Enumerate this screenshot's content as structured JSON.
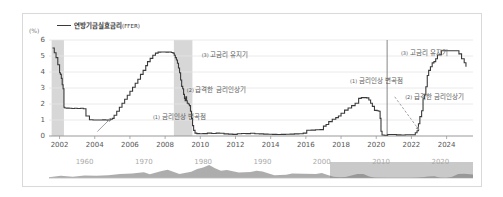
{
  "chart_data": {
    "type": "line",
    "title": "",
    "xlabel": "",
    "ylabel": "(%)",
    "unit_label": "(%)",
    "xlim": [
      2001.4,
      2025.5
    ],
    "ylim": [
      0,
      6
    ],
    "yticks": [
      0,
      1,
      2,
      3,
      4,
      5,
      6
    ],
    "ytick_labels": [
      "0",
      "1",
      "2",
      "3",
      "4",
      "5",
      "6"
    ],
    "xticks": [
      2002,
      2004,
      2006,
      2008,
      2010,
      2012,
      2014,
      2016,
      2018,
      2020,
      2022,
      2024
    ],
    "xtick_labels": [
      "2002",
      "2004",
      "2006",
      "2008",
      "2010",
      "2012",
      "2014",
      "2016",
      "2018",
      "2020",
      "2022",
      "2024"
    ],
    "grid": true,
    "legend": {
      "position": "top-left",
      "entries": [
        {
          "label": "연방기금실효금리",
          "suffix": "(FFER)",
          "color": "#3a3a3a"
        }
      ]
    },
    "series": [
      {
        "name": "연방기금실효금리(FFER)",
        "color": "#3a3a3a",
        "points": [
          [
            2001.6,
            5.5
          ],
          [
            2001.7,
            5.2
          ],
          [
            2001.8,
            4.9
          ],
          [
            2001.9,
            4.45
          ],
          [
            2002.0,
            3.95
          ],
          [
            2002.05,
            3.85
          ],
          [
            2002.1,
            3.6
          ],
          [
            2002.15,
            3.2
          ],
          [
            2002.2,
            2.95
          ],
          [
            2002.25,
            1.8
          ],
          [
            2002.3,
            1.75
          ],
          [
            2002.4,
            1.74
          ],
          [
            2002.55,
            1.73
          ],
          [
            2002.7,
            1.72
          ],
          [
            2002.85,
            1.73
          ],
          [
            2003.0,
            1.72
          ],
          [
            2003.2,
            1.73
          ],
          [
            2003.35,
            1.7
          ],
          [
            2003.5,
            1.25
          ],
          [
            2003.7,
            1.02
          ],
          [
            2003.9,
            1.0
          ],
          [
            2004.1,
            1.0
          ],
          [
            2004.3,
            1.0
          ],
          [
            2004.45,
            1.01
          ],
          [
            2004.55,
            1.02
          ],
          [
            2004.62,
            1.0
          ],
          [
            2004.72,
            0.98
          ],
          [
            2004.82,
            1.0
          ],
          [
            2004.9,
            1.05
          ],
          [
            2005.0,
            1.1
          ],
          [
            2005.1,
            1.3
          ],
          [
            2005.25,
            1.55
          ],
          [
            2005.4,
            1.8
          ],
          [
            2005.55,
            2.05
          ],
          [
            2005.7,
            2.3
          ],
          [
            2005.85,
            2.55
          ],
          [
            2006.0,
            2.8
          ],
          [
            2006.15,
            3.05
          ],
          [
            2006.3,
            3.3
          ],
          [
            2006.45,
            3.55
          ],
          [
            2006.6,
            3.85
          ],
          [
            2006.75,
            4.1
          ],
          [
            2006.9,
            4.4
          ],
          [
            2007.0,
            4.65
          ],
          [
            2007.15,
            4.85
          ],
          [
            2007.3,
            5.05
          ],
          [
            2007.45,
            5.18
          ],
          [
            2007.6,
            5.24
          ],
          [
            2007.75,
            5.25
          ],
          [
            2007.9,
            5.25
          ],
          [
            2008.05,
            5.24
          ],
          [
            2008.2,
            5.25
          ],
          [
            2008.35,
            5.22
          ],
          [
            2008.45,
            5.18
          ],
          [
            2008.52,
            5.05
          ],
          [
            2008.58,
            4.9
          ],
          [
            2008.64,
            4.75
          ],
          [
            2008.7,
            4.55
          ],
          [
            2008.76,
            4.25
          ],
          [
            2008.82,
            3.95
          ],
          [
            2008.88,
            3.5
          ],
          [
            2008.94,
            3.1
          ],
          [
            2009.0,
            2.95
          ],
          [
            2009.05,
            2.6
          ],
          [
            2009.1,
            2.35
          ],
          [
            2009.14,
            2.2
          ],
          [
            2009.18,
            2.45
          ],
          [
            2009.22,
            2.2
          ],
          [
            2009.26,
            2.05
          ],
          [
            2009.32,
            2.0
          ],
          [
            2009.38,
            1.9
          ],
          [
            2009.44,
            1.55
          ],
          [
            2009.5,
            1.1
          ],
          [
            2009.56,
            0.65
          ],
          [
            2009.62,
            0.35
          ],
          [
            2009.7,
            0.18
          ],
          [
            2009.8,
            0.15
          ],
          [
            2009.95,
            0.14
          ],
          [
            2010.15,
            0.15
          ],
          [
            2010.4,
            0.18
          ],
          [
            2010.65,
            0.16
          ],
          [
            2010.9,
            0.18
          ],
          [
            2011.1,
            0.17
          ],
          [
            2011.35,
            0.13
          ],
          [
            2011.6,
            0.12
          ],
          [
            2011.85,
            0.1
          ],
          [
            2012.1,
            0.14
          ],
          [
            2012.35,
            0.16
          ],
          [
            2012.6,
            0.15
          ],
          [
            2012.85,
            0.17
          ],
          [
            2013.1,
            0.14
          ],
          [
            2013.35,
            0.13
          ],
          [
            2013.6,
            0.12
          ],
          [
            2013.85,
            0.11
          ],
          [
            2014.1,
            0.1
          ],
          [
            2014.35,
            0.09
          ],
          [
            2014.6,
            0.1
          ],
          [
            2014.85,
            0.11
          ],
          [
            2015.1,
            0.12
          ],
          [
            2015.35,
            0.13
          ],
          [
            2015.6,
            0.14
          ],
          [
            2015.85,
            0.18
          ],
          [
            2016.05,
            0.36
          ],
          [
            2016.3,
            0.37
          ],
          [
            2016.55,
            0.39
          ],
          [
            2016.8,
            0.4
          ],
          [
            2017.0,
            0.62
          ],
          [
            2017.15,
            0.72
          ],
          [
            2017.3,
            0.9
          ],
          [
            2017.5,
            1.05
          ],
          [
            2017.7,
            1.15
          ],
          [
            2017.85,
            1.25
          ],
          [
            2018.0,
            1.42
          ],
          [
            2018.2,
            1.62
          ],
          [
            2018.4,
            1.75
          ],
          [
            2018.6,
            1.9
          ],
          [
            2018.8,
            2.05
          ],
          [
            2019.0,
            2.35
          ],
          [
            2019.15,
            2.4
          ],
          [
            2019.3,
            2.4
          ],
          [
            2019.45,
            2.38
          ],
          [
            2019.58,
            2.25
          ],
          [
            2019.68,
            2.05
          ],
          [
            2019.78,
            1.85
          ],
          [
            2019.9,
            1.6
          ],
          [
            2020.05,
            1.58
          ],
          [
            2020.15,
            1.55
          ],
          [
            2020.22,
            1.1
          ],
          [
            2020.27,
            0.3
          ],
          [
            2020.33,
            0.06
          ],
          [
            2020.45,
            0.05
          ],
          [
            2020.65,
            0.09
          ],
          [
            2020.9,
            0.09
          ],
          [
            2021.15,
            0.07
          ],
          [
            2021.4,
            0.06
          ],
          [
            2021.65,
            0.08
          ],
          [
            2021.9,
            0.08
          ],
          [
            2022.1,
            0.08
          ],
          [
            2022.22,
            0.2
          ],
          [
            2022.32,
            0.33
          ],
          [
            2022.4,
            0.77
          ],
          [
            2022.48,
            1.21
          ],
          [
            2022.58,
            1.58
          ],
          [
            2022.66,
            2.33
          ],
          [
            2022.74,
            2.56
          ],
          [
            2022.82,
            3.08
          ],
          [
            2022.9,
            3.78
          ],
          [
            2022.98,
            4.1
          ],
          [
            2023.08,
            4.33
          ],
          [
            2023.18,
            4.57
          ],
          [
            2023.28,
            4.65
          ],
          [
            2023.38,
            4.83
          ],
          [
            2023.48,
            5.06
          ],
          [
            2023.58,
            5.08
          ],
          [
            2023.7,
            5.33
          ],
          [
            2023.85,
            5.33
          ],
          [
            2024.05,
            5.33
          ],
          [
            2024.3,
            5.33
          ],
          [
            2024.55,
            5.33
          ],
          [
            2024.7,
            5.13
          ],
          [
            2024.85,
            4.83
          ],
          [
            2025.0,
            4.58
          ],
          [
            2025.1,
            4.33
          ]
        ]
      }
    ],
    "shaded_bands": [
      {
        "name": "recession-2001",
        "x0": 2001.55,
        "x1": 2002.25,
        "color": "#c9c9c9"
      },
      {
        "name": "recession-2008",
        "x0": 2008.5,
        "x1": 2009.55,
        "color": "#c9c9c9"
      }
    ],
    "vertical_lines": [
      {
        "name": "inflection-2020",
        "x": 2020.62,
        "color": "#9a9a9a"
      }
    ],
    "annotations": [
      {
        "id": "a1",
        "index": "(1)",
        "text": "금리인상 변곡점",
        "x_pct": 24.5,
        "y_pct": 74.0,
        "arrow": "left-up"
      },
      {
        "id": "a2",
        "index": "(2)",
        "text": "급격한 금리인상기",
        "x_pct": 32.5,
        "y_pct": 46.0
      },
      {
        "id": "a3",
        "index": "(3)",
        "text": "고금리 유지기",
        "x_pct": 36.0,
        "y_pct": 9.0
      },
      {
        "id": "a4",
        "index": "(1)",
        "text": "금리인상 변곡점",
        "x_pct": 71.0,
        "y_pct": 36.0,
        "arrow": "down-right"
      },
      {
        "id": "a5",
        "index": "(2)",
        "text": "급격한 금리인상기",
        "x_pct": 84.0,
        "y_pct": 53.0
      },
      {
        "id": "a6",
        "index": "(3)",
        "text": "고금리 유지기",
        "x_pct": 83.0,
        "y_pct": 7.0
      }
    ],
    "overview": {
      "type": "area",
      "xlim": [
        1954,
        2025.5
      ],
      "tick_labels": [
        "1960",
        "1970",
        "1980",
        "1990",
        "2000",
        "2010",
        "2020"
      ],
      "ticks": [
        1960,
        1970,
        1980,
        1990,
        2000,
        2010,
        2020
      ],
      "selection": {
        "x0": 2001.4,
        "x1": 2025.5
      },
      "selection_color": "#787878",
      "series_values": [
        [
          1954,
          1.0
        ],
        [
          1956,
          2.7
        ],
        [
          1958,
          1.6
        ],
        [
          1960,
          3.2
        ],
        [
          1962,
          2.7
        ],
        [
          1964,
          3.5
        ],
        [
          1966,
          5.1
        ],
        [
          1968,
          5.7
        ],
        [
          1970,
          7.2
        ],
        [
          1971,
          4.7
        ],
        [
          1973,
          8.7
        ],
        [
          1974,
          10.5
        ],
        [
          1976,
          5.0
        ],
        [
          1978,
          7.9
        ],
        [
          1979,
          11.2
        ],
        [
          1980,
          13.4
        ],
        [
          1981,
          16.4
        ],
        [
          1982,
          12.3
        ],
        [
          1983,
          9.1
        ],
        [
          1984,
          10.2
        ],
        [
          1986,
          6.8
        ],
        [
          1988,
          7.6
        ],
        [
          1989,
          9.2
        ],
        [
          1990,
          8.1
        ],
        [
          1992,
          3.5
        ],
        [
          1994,
          4.2
        ],
        [
          1995,
          5.8
        ],
        [
          1997,
          5.5
        ],
        [
          1999,
          5.0
        ],
        [
          2000,
          6.2
        ],
        [
          2001,
          3.9
        ],
        [
          2002,
          1.7
        ],
        [
          2003,
          1.1
        ],
        [
          2004,
          1.4
        ],
        [
          2005,
          3.2
        ],
        [
          2006,
          5.0
        ],
        [
          2007,
          5.0
        ],
        [
          2008,
          1.9
        ],
        [
          2009,
          0.2
        ],
        [
          2011,
          0.1
        ],
        [
          2013,
          0.1
        ],
        [
          2015,
          0.1
        ],
        [
          2016,
          0.4
        ],
        [
          2017,
          1.0
        ],
        [
          2018,
          1.8
        ],
        [
          2019,
          2.2
        ],
        [
          2020,
          0.4
        ],
        [
          2021,
          0.1
        ],
        [
          2022,
          1.7
        ],
        [
          2023,
          5.0
        ],
        [
          2024,
          5.3
        ],
        [
          2025.5,
          4.4
        ]
      ]
    },
    "colors": {
      "line": "#3a3a3a",
      "band": "#c9c9c9",
      "grid": "#e4e4e4",
      "axis": "#999999",
      "annotation_text": "#5a5a5a",
      "overview_area": "#8d8d8d",
      "overview_label": "#b0b0b0",
      "card_border": "#d9d9d9"
    }
  }
}
